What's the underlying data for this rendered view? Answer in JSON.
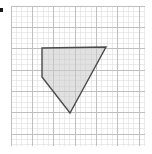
{
  "figure": {
    "canvas": {
      "width": 152,
      "height": 154,
      "background_color": "#ffffff"
    },
    "grid": {
      "type": "square-grid",
      "origin_x": 11,
      "origin_y": 6,
      "right": 145,
      "bottom": 146,
      "minor_cell_size": 5.34,
      "minor_columns": 25,
      "minor_rows": 26,
      "major_every": 4,
      "minor_color": "#dedede",
      "major_color": "#bfbfbf",
      "minor_width": 0.6,
      "major_width": 1.0,
      "show_grid": true
    },
    "shape": {
      "name": "shaded-quadrilateral",
      "kind": "polygon",
      "vertex_count": 4,
      "points_px": [
        [
          42,
          48
        ],
        [
          106,
          47
        ],
        [
          70,
          113
        ],
        [
          42,
          77
        ]
      ],
      "points_attr": "42,48 106,47 70,113 42,77",
      "fill_color": "#c9c9c9",
      "fill_opacity": 0.55,
      "stroke_color": "#4a4a4a",
      "stroke_width": 1.4,
      "closed": true
    },
    "edge_marker": {
      "name": "left-edge-tick",
      "color": "#1a1a1a",
      "x": 0,
      "y": 8,
      "width": 3,
      "height": 4
    }
  },
  "chart_data": {
    "type": "scatter",
    "xlabel": "",
    "ylabel": "",
    "grid": true,
    "legend": "none",
    "xlim": [
      0,
      25
    ],
    "ylim": [
      0,
      26
    ],
    "annotations": [],
    "series": [
      {
        "name": "quadrilateral-vertices",
        "kind": "polygon",
        "x": [
          5.8,
          17.8,
          11.0,
          5.8
        ],
        "y": [
          7.9,
          8.1,
          -1.3,
          2.6
        ],
        "values": [
          {
            "label": "top-left",
            "x": 5.8,
            "y": 7.9
          },
          {
            "label": "top-right",
            "x": 17.8,
            "y": 8.1
          },
          {
            "label": "bottom-apex",
            "x": 11.0,
            "y": -1.3
          },
          {
            "label": "left-lower",
            "x": 5.8,
            "y": 2.6
          }
        ]
      }
    ]
  }
}
